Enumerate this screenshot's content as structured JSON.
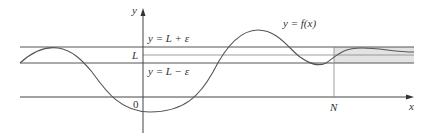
{
  "diagram": {
    "axis_labels": {
      "x": "x",
      "y": "y"
    },
    "origin_label": "0",
    "curve_label": "y = f(x)",
    "band_labels": {
      "upper": "y = L + ε",
      "middle": "L",
      "lower": "y = L − ε"
    },
    "n_label": "N",
    "colors": {
      "line": "#555555",
      "axis": "#444444",
      "shade": "#e3e3e3",
      "text": "#333333"
    }
  }
}
